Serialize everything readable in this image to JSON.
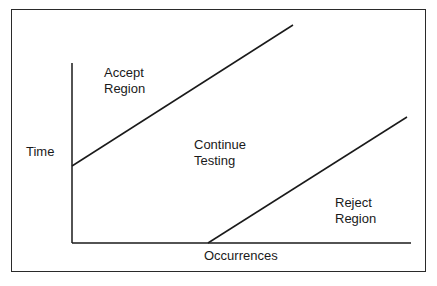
{
  "diagram": {
    "type": "sequential-test-chart",
    "axes": {
      "y_label": "Time",
      "x_label": "Occurrences"
    },
    "regions": [
      {
        "id": "accept",
        "label": "Accept\nRegion"
      },
      {
        "id": "continue",
        "label": "Continue\nTesting"
      },
      {
        "id": "reject",
        "label": "Reject\nRegion"
      }
    ],
    "boundary_lines": [
      {
        "name": "accept-boundary",
        "x1": 72,
        "y1": 166,
        "x2": 293,
        "y2": 25
      },
      {
        "name": "reject-boundary",
        "x1": 208,
        "y1": 243,
        "x2": 407,
        "y2": 117
      }
    ],
    "colors": {
      "line": "#1a1a1a",
      "background": "#ffffff"
    }
  }
}
